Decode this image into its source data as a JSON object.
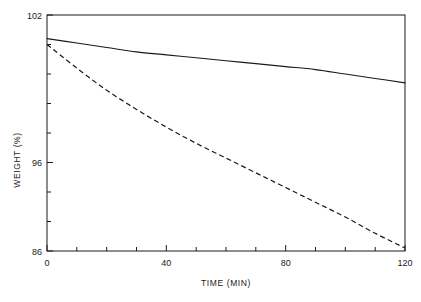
{
  "chart_data": {
    "type": "line",
    "title": "",
    "xlabel": "TIME (MIN)",
    "ylabel": "WEIGHT (%)",
    "xlim": [
      0,
      120
    ],
    "ylim": [
      86,
      102
    ],
    "xticks": [
      0,
      40,
      80,
      120
    ],
    "xtick_labels": [
      "0",
      "40",
      "80",
      "120"
    ],
    "yticks": [
      86,
      96,
      102
    ],
    "ytick_labels": [
      "86",
      "96",
      "102"
    ],
    "x_minor_tick_interval": 10,
    "y_minor_tick_interval": 2,
    "grid": false,
    "legend": false,
    "frame": "box",
    "x": [
      0,
      10,
      20,
      30,
      40,
      50,
      60,
      70,
      80,
      90,
      100,
      110,
      120
    ],
    "series": [
      {
        "name": "solid-curve",
        "style": "solid",
        "color": "#1a1a1a",
        "values": [
          100.4,
          100.1,
          99.8,
          99.5,
          99.3,
          99.1,
          98.9,
          98.7,
          98.5,
          98.3,
          98.0,
          97.7,
          97.4
        ]
      },
      {
        "name": "dashed-curve",
        "style": "dashed",
        "color": "#1a1a1a",
        "values": [
          100.0,
          98.4,
          96.9,
          95.6,
          94.4,
          93.3,
          92.3,
          91.3,
          90.3,
          89.3,
          88.3,
          87.2,
          86.2
        ]
      }
    ]
  },
  "axes": {
    "y_title": "WEIGHT (%)",
    "x_title": "TIME (MIN)",
    "y_labels": {
      "top": "102",
      "mid": "96",
      "bottom": "86"
    },
    "x_labels": {
      "t0": "0",
      "t40": "40",
      "t80": "80",
      "t120": "120"
    }
  }
}
